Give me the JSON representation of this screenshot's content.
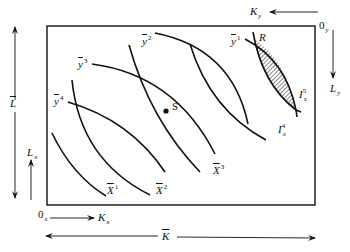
{
  "diagram": {
    "type": "edgeworth-box",
    "box_labels": {
      "total_labor": "L",
      "total_capital": "K",
      "origin_x": "0",
      "origin_x_sub": "x",
      "origin_y": "0",
      "origin_y_sub": "y",
      "labor_x": "L",
      "labor_x_sub": "x",
      "capital_x": "K",
      "capital_x_sub": "x",
      "labor_y": "L",
      "labor_y_sub": "y",
      "capital_y": "K",
      "capital_y_sub": "y"
    },
    "isoquants_x": [
      {
        "base": "X",
        "sup": "1"
      },
      {
        "base": "X",
        "sup": "2"
      },
      {
        "base": "X",
        "sup": "3"
      },
      {
        "base": "I",
        "sub": "x",
        "sup": "4"
      },
      {
        "base": "I",
        "sub": "x",
        "sup": "5"
      }
    ],
    "isoquants_y": [
      {
        "base": "y",
        "sup": "1"
      },
      {
        "base": "y",
        "sup": "2"
      },
      {
        "base": "y",
        "sup": "3"
      },
      {
        "base": "y",
        "sup": "4"
      }
    ],
    "points": {
      "tangency": "S",
      "region": "R"
    },
    "colors": {
      "line": "#111111",
      "background": "#ffffff"
    }
  }
}
